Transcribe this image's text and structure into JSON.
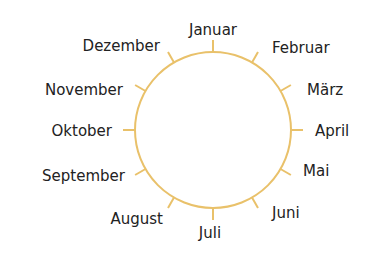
{
  "diagram": {
    "type": "month-circle",
    "stroke_color": "#E9C16A",
    "text_color": "#222222",
    "circle": {
      "cx": 213,
      "cy": 130,
      "r": 78,
      "tick_length": 12
    },
    "months": [
      {
        "label": "Januar",
        "angle": 0,
        "x": 213,
        "y": 30,
        "align": "c"
      },
      {
        "label": "Februar",
        "angle": 30,
        "x": 272,
        "y": 48,
        "align": "l"
      },
      {
        "label": "März",
        "angle": 60,
        "x": 307,
        "y": 90,
        "align": "l"
      },
      {
        "label": "April",
        "angle": 90,
        "x": 315,
        "y": 131,
        "align": "l"
      },
      {
        "label": "Mai",
        "angle": 120,
        "x": 303,
        "y": 171,
        "align": "l"
      },
      {
        "label": "Juni",
        "angle": 150,
        "x": 272,
        "y": 213,
        "align": "l"
      },
      {
        "label": "Juli",
        "angle": 180,
        "x": 210,
        "y": 233,
        "align": "c"
      },
      {
        "label": "August",
        "angle": 210,
        "x": 163,
        "y": 219,
        "align": "r"
      },
      {
        "label": "September",
        "angle": 240,
        "x": 125,
        "y": 176,
        "align": "r"
      },
      {
        "label": "Oktober",
        "angle": 270,
        "x": 112,
        "y": 131,
        "align": "r"
      },
      {
        "label": "November",
        "angle": 300,
        "x": 123,
        "y": 90,
        "align": "r"
      },
      {
        "label": "Dezember",
        "angle": 330,
        "x": 160,
        "y": 46,
        "align": "r"
      }
    ]
  }
}
